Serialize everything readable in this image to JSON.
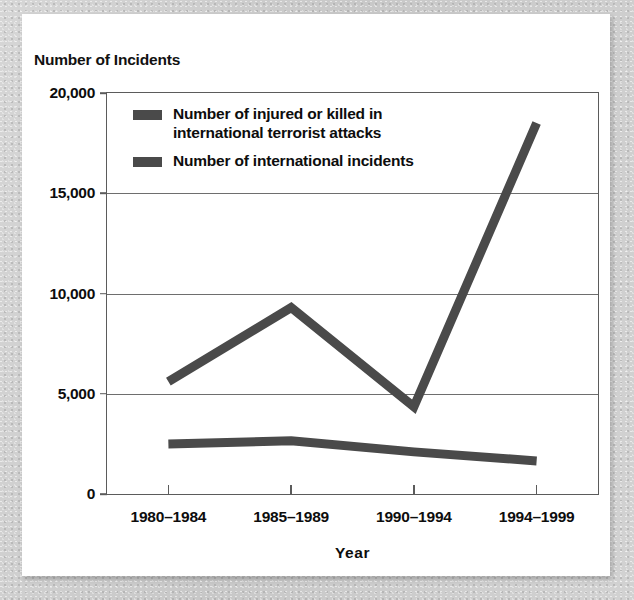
{
  "figure": {
    "title": "Number of Incidents",
    "x_axis_title": "Year",
    "line_color": "#4a4a4a",
    "axis_color": "#5b5b5b",
    "background_color": "#ffffff"
  },
  "legend": {
    "items": [
      {
        "label": "Number of injured or killed in international terrorist attacks",
        "swatch_name": "legend-swatch-injured-killed"
      },
      {
        "label": "Number of international incidents",
        "swatch_name": "legend-swatch-international-incidents"
      }
    ]
  },
  "axes": {
    "y_ticks": [
      "0",
      "5,000",
      "10,000",
      "15,000",
      "20,000"
    ],
    "y_tick_values": [
      0,
      5000,
      10000,
      15000,
      20000
    ],
    "x_ticks": [
      "1980–1984",
      "1985–1989",
      "1990–1994",
      "1994–1999"
    ]
  },
  "chart_data": {
    "type": "line",
    "title": "Number of Incidents",
    "xlabel": "Year",
    "ylabel": "Number of Incidents",
    "categories": [
      "1980–1984",
      "1985–1989",
      "1990–1994",
      "1994–1999"
    ],
    "series": [
      {
        "name": "Number of injured or killed in international terrorist attacks",
        "values": [
          5600,
          9300,
          4350,
          18500
        ],
        "color": "#4a4a4a"
      },
      {
        "name": "Number of international incidents",
        "values": [
          2500,
          2650,
          2100,
          1650
        ],
        "color": "#4a4a4a"
      }
    ],
    "ylim": [
      0,
      20000
    ],
    "yticks": [
      0,
      5000,
      10000,
      15000,
      20000
    ],
    "grid": true,
    "legend_position": "inside-top-left"
  }
}
